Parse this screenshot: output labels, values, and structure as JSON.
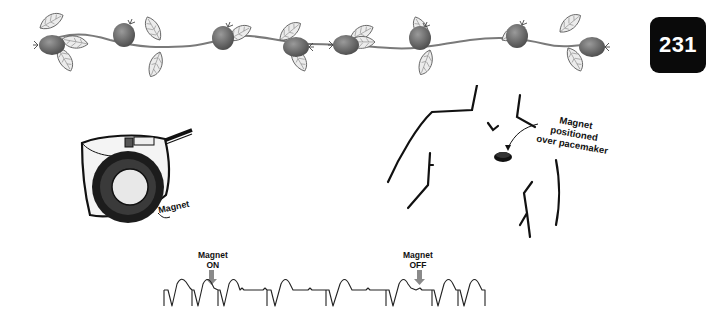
{
  "page": {
    "number": "231"
  },
  "decoration": {
    "type": "rosehip-garland",
    "berry_color": "#6e6e6e",
    "leaf_color": "#e8e8e8"
  },
  "figure_device": {
    "label": "Magnet"
  },
  "figure_chest": {
    "label_lines": [
      "Magnet",
      "positioned",
      "over pacemaker"
    ]
  },
  "ecg_strip": {
    "marker_on": {
      "line1": "Magnet",
      "line2": "ON"
    },
    "marker_off": {
      "line1": "Magnet",
      "line2": "OFF"
    }
  },
  "colors": {
    "badge_bg": "#0a0a0a",
    "badge_text": "#ffffff",
    "line": "#222222",
    "arrow": "#8a8a8a"
  }
}
